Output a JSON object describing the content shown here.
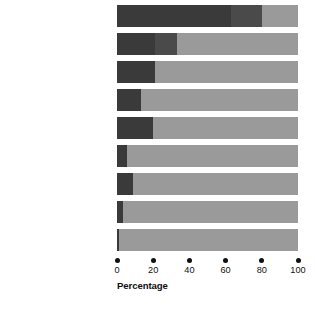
{
  "chart_data": {
    "type": "bar",
    "orientation": "horizontal",
    "stacked": true,
    "title": "",
    "xlabel": "Percentage",
    "ylabel": "",
    "xlim": [
      0,
      100
    ],
    "xticks": [
      0,
      20,
      40,
      60,
      80,
      100
    ],
    "xtick_labels": [
      "0",
      "20",
      "40",
      "60",
      "80",
      "100"
    ],
    "grid": false,
    "legend": "none",
    "colors": {
      "dark": "#3a3a3a",
      "mid": "#4a4a4a",
      "light": "#9a9a9a",
      "background": "#ffffff",
      "text": "#101010"
    },
    "categories": [
      "Agriculture, forestry, and fishing",
      "Services",
      "Construction",
      "Retail trade",
      "Mining",
      "Transport and public utilities",
      "Finance, insurance, and real estate",
      "Wholesale trade",
      "Manufacturing"
    ],
    "values": [
      80,
      33,
      21,
      13,
      20,
      5.5,
      9,
      3.5,
      1
    ],
    "series": [
      {
        "name": "dark",
        "values": [
          80,
          33,
          21,
          13,
          20,
          5.5,
          9,
          3.5,
          1
        ]
      },
      {
        "name": "light",
        "values": [
          20,
          67,
          79,
          87,
          80,
          94.5,
          91,
          96.5,
          99
        ]
      }
    ]
  },
  "rows": [
    {
      "label_lines": [
        "Agriculture,",
        "forestry, and fishing"
      ],
      "value": 80,
      "inner_break": 63
    },
    {
      "label_lines": [
        "Services"
      ],
      "value": 33,
      "inner_break": 21
    },
    {
      "label_lines": [
        "Construction"
      ],
      "value": 21,
      "inner_break": 0
    },
    {
      "label_lines": [
        "Retail trade"
      ],
      "value": 13,
      "inner_break": 0
    },
    {
      "label_lines": [
        "Mining"
      ],
      "value": 20,
      "inner_break": 0
    },
    {
      "label_lines": [
        "Transport and",
        "public utilities"
      ],
      "value": 5.5,
      "inner_break": 0
    },
    {
      "label_lines": [
        "Finance, insurance,",
        "and real estate"
      ],
      "value": 9,
      "inner_break": 0
    },
    {
      "label_lines": [
        "Wholesale trade"
      ],
      "value": 3.5,
      "inner_break": 0
    },
    {
      "label_lines": [
        "Manufacturing"
      ],
      "value": 1,
      "inner_break": 0
    }
  ],
  "axis": {
    "title": "Percentage",
    "ticks": [
      {
        "value": 0,
        "label": "0"
      },
      {
        "value": 20,
        "label": "20"
      },
      {
        "value": 40,
        "label": "40"
      },
      {
        "value": 60,
        "label": "60"
      },
      {
        "value": 80,
        "label": "80"
      },
      {
        "value": 100,
        "label": "100"
      }
    ]
  }
}
